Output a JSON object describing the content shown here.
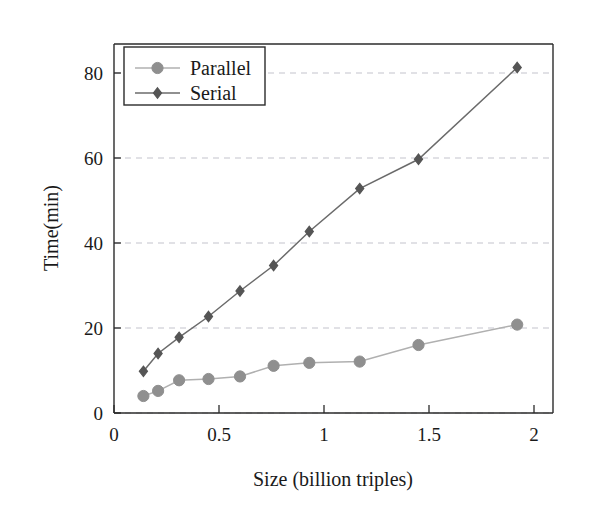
{
  "chart_data": {
    "type": "line",
    "title": "",
    "xlabel": "Size (billion triples)",
    "ylabel": "Time(min)",
    "xlim": [
      0,
      2.08
    ],
    "ylim": [
      -2,
      87
    ],
    "xticks": [
      0,
      0.5,
      1,
      1.5,
      2
    ],
    "xticklabels": [
      "0",
      "0.5",
      "1",
      "1.5",
      "2"
    ],
    "yticks": [
      0,
      20,
      40,
      60,
      80
    ],
    "yticklabels": [
      "0",
      "20",
      "40",
      "60",
      "80"
    ],
    "grid": "horizontal-dashed",
    "legend_position": "top-left",
    "series": [
      {
        "name": "Parallel",
        "marker": "circle",
        "color": "#8f8f8f",
        "line_color": "#b0b0b0",
        "x": [
          0.14,
          0.21,
          0.31,
          0.45,
          0.6,
          0.76,
          0.93,
          1.17,
          1.45,
          1.92
        ],
        "values": [
          4.0,
          5.2,
          7.7,
          8.0,
          8.6,
          11.1,
          11.8,
          12.1,
          16.0,
          20.8
        ]
      },
      {
        "name": "Serial",
        "marker": "diamond",
        "color": "#555555",
        "line_color": "#6b6b6b",
        "x": [
          0.14,
          0.21,
          0.31,
          0.45,
          0.6,
          0.76,
          0.93,
          1.17,
          1.45,
          1.92
        ],
        "values": [
          9.8,
          14.0,
          17.8,
          22.7,
          28.7,
          34.7,
          42.7,
          52.8,
          59.7,
          81.3
        ]
      }
    ]
  },
  "legend": {
    "entries": [
      {
        "label": "Parallel"
      },
      {
        "label": "Serial"
      }
    ]
  },
  "axes": {
    "x_label": "Size (billion triples)",
    "y_label": "Time(min)"
  }
}
